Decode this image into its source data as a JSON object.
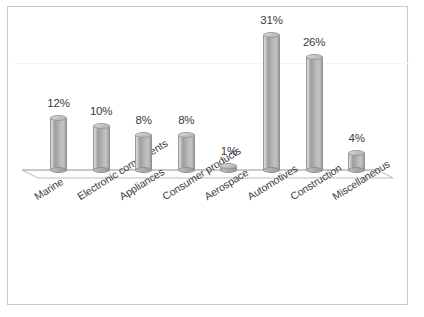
{
  "chart_data": {
    "type": "bar",
    "title": "",
    "subtitle": "",
    "xlabel": "",
    "ylabel": "",
    "ylim": [
      0,
      34
    ],
    "grid": false,
    "legend": false,
    "style": "3d-cylinder",
    "value_suffix": "%",
    "categories": [
      "Marine",
      "Electronic components",
      "Appliances",
      "Consumer products",
      "Aerospace",
      "Automotives",
      "Construction",
      "Miscellaneous"
    ],
    "values": [
      12,
      10,
      8,
      8,
      1,
      31,
      26,
      4
    ],
    "data_labels": [
      "12%",
      "10%",
      "8%",
      "8%",
      "1%",
      "31%",
      "26%",
      "4%"
    ],
    "colors": {
      "bar_light": "#d9d9d9",
      "bar_mid": "#b0b0b0",
      "bar_dark": "#9a9a9a",
      "border": "#c9c9c9",
      "floor_line": "#bdbdbd",
      "text": "#3a3a3a",
      "background": "#ffffff"
    }
  }
}
